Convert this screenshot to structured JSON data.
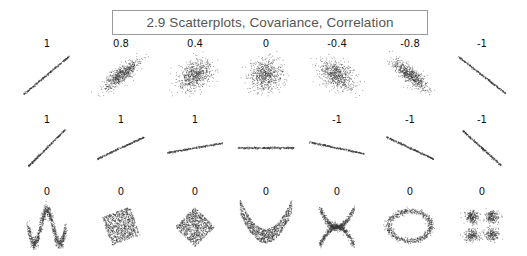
{
  "title": "2.9 Scatterplots, Covariance, Correlation",
  "chart_data": {
    "type": "scatter",
    "title": "2.9 Scatterplots, Covariance, Correlation",
    "xlabel": "",
    "ylabel": "",
    "grid": false,
    "rows": [
      {
        "description": "Bivariate normal samples with varying correlation",
        "panels": [
          {
            "label": "1",
            "correlation": 1,
            "shape": "line",
            "slope": 1
          },
          {
            "label": "0.8",
            "correlation": 0.8,
            "shape": "cloud"
          },
          {
            "label": "0.4",
            "correlation": 0.4,
            "shape": "cloud"
          },
          {
            "label": "0",
            "correlation": 0,
            "shape": "cloud"
          },
          {
            "label": "-0.4",
            "correlation": -0.4,
            "shape": "cloud"
          },
          {
            "label": "-0.8",
            "correlation": -0.8,
            "shape": "cloud"
          },
          {
            "label": "-1",
            "correlation": -1,
            "shape": "line",
            "slope": -1
          }
        ]
      },
      {
        "description": "Perfect linear relationships with varying slope",
        "panels": [
          {
            "label": "1",
            "correlation": 1,
            "shape": "line",
            "angle_deg": 45
          },
          {
            "label": "1",
            "correlation": 1,
            "shape": "line",
            "angle_deg": 25
          },
          {
            "label": "1",
            "correlation": 1,
            "shape": "line",
            "angle_deg": 10
          },
          {
            "label": "",
            "correlation": null,
            "shape": "line",
            "angle_deg": 0
          },
          {
            "label": "-1",
            "correlation": -1,
            "shape": "line",
            "angle_deg": -12
          },
          {
            "label": "-1",
            "correlation": -1,
            "shape": "line",
            "angle_deg": -25
          },
          {
            "label": "-1",
            "correlation": -1,
            "shape": "line",
            "angle_deg": -42
          }
        ]
      },
      {
        "description": "Nonlinear relationships with zero correlation",
        "panels": [
          {
            "label": "0",
            "correlation": 0,
            "shape": "w-wave"
          },
          {
            "label": "0",
            "correlation": 0,
            "shape": "tilted-square"
          },
          {
            "label": "0",
            "correlation": 0,
            "shape": "diamond"
          },
          {
            "label": "0",
            "correlation": 0,
            "shape": "parabola"
          },
          {
            "label": "0",
            "correlation": 0,
            "shape": "x-cross"
          },
          {
            "label": "0",
            "correlation": 0,
            "shape": "ring"
          },
          {
            "label": "0",
            "correlation": 0,
            "shape": "four-clusters"
          }
        ]
      }
    ]
  },
  "colors": {
    "points": "#333333",
    "title_border": "#9a9a9a",
    "title_text": "#555555"
  }
}
